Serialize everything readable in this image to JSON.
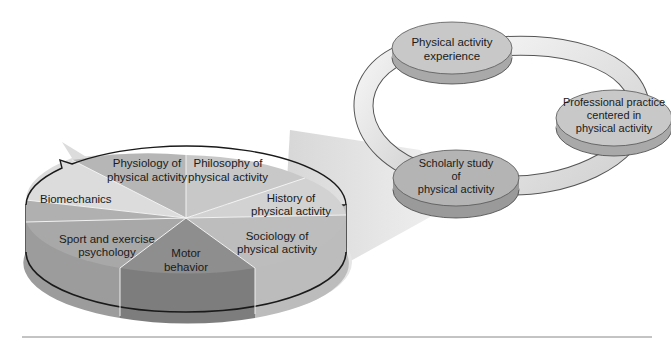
{
  "cycle": {
    "nodes": [
      {
        "id": "experience",
        "lines": [
          "Physical activity",
          "experience"
        ]
      },
      {
        "id": "professional",
        "lines": [
          "Professional practice",
          "centered in",
          "physical activity"
        ]
      },
      {
        "id": "scholarly",
        "lines": [
          "Scholarly study",
          "of",
          "physical activity"
        ]
      }
    ]
  },
  "pie": {
    "slices": [
      {
        "id": "physiology",
        "lines": [
          "Physiology of",
          "physical activity"
        ]
      },
      {
        "id": "philosophy",
        "lines": [
          "Philosophy of",
          "physical activity"
        ]
      },
      {
        "id": "history",
        "lines": [
          "History of",
          "physical activity"
        ]
      },
      {
        "id": "sociology",
        "lines": [
          "Sociology of",
          "physical activity"
        ]
      },
      {
        "id": "motor",
        "lines": [
          "Motor",
          "behavior"
        ]
      },
      {
        "id": "sport-psych",
        "lines": [
          "Sport and exercise",
          "psychology"
        ]
      },
      {
        "id": "biomechanics",
        "lines": [
          "Biomechanics"
        ]
      }
    ]
  },
  "colors": {
    "pie_light": "#d6d6d6",
    "pie_mid": "#bdbdbd",
    "pie_dark": "#8f8f8f",
    "disc_top": "#c4c4c4",
    "disc_side": "#a8a8a8",
    "ring": "#e2e2e2",
    "outline": "#1a1a1a"
  }
}
